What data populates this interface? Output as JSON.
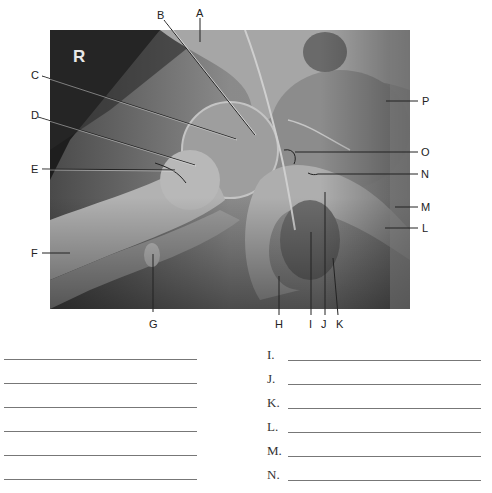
{
  "figure": {
    "orientation_marker": "R",
    "callout_labels": {
      "A": "A",
      "B": "B",
      "C": "C",
      "D": "D",
      "E": "E",
      "F": "F",
      "G": "G",
      "H": "H",
      "I": "I",
      "J": "J",
      "K": "K",
      "L": "L",
      "M": "M",
      "N": "N",
      "O": "O",
      "P": "P"
    }
  },
  "answer_blanks": {
    "left_column": [
      {
        "letter": "",
        "value": ""
      },
      {
        "letter": "",
        "value": ""
      },
      {
        "letter": "",
        "value": ""
      },
      {
        "letter": "",
        "value": ""
      },
      {
        "letter": "",
        "value": ""
      },
      {
        "letter": "",
        "value": ""
      }
    ],
    "right_column": [
      {
        "letter": "I.",
        "value": ""
      },
      {
        "letter": "J.",
        "value": ""
      },
      {
        "letter": "K.",
        "value": ""
      },
      {
        "letter": "L.",
        "value": ""
      },
      {
        "letter": "M.",
        "value": ""
      },
      {
        "letter": "N.",
        "value": ""
      }
    ]
  }
}
